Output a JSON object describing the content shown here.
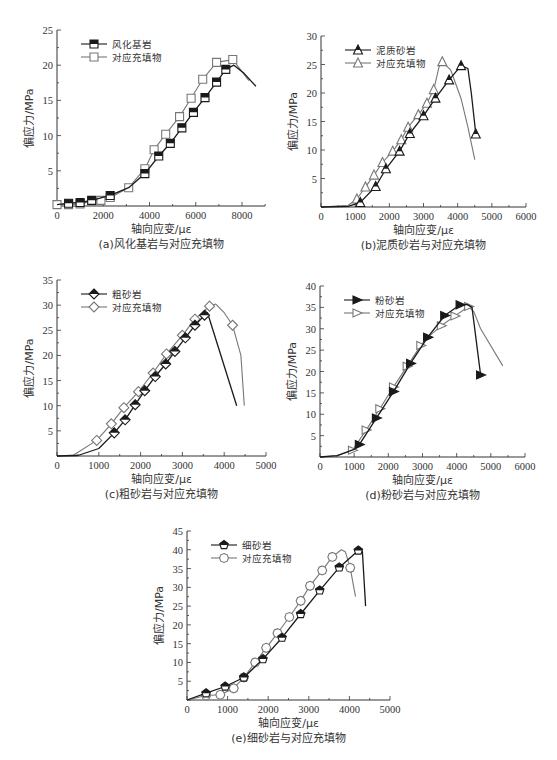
{
  "figure": {
    "panels_count": 5
  },
  "chart_data": [
    {
      "id": "a",
      "type": "line",
      "caption": "(a)风化基岩与对应充填物",
      "xlabel": "轴向应变/με",
      "ylabel": "偏应力/MPa",
      "xlim": [
        0,
        9000
      ],
      "ylim": [
        0,
        25
      ],
      "xticks": [
        0,
        2000,
        4000,
        6000,
        8000
      ],
      "yticks": [
        5,
        10,
        15,
        20,
        25
      ],
      "grid": false,
      "legend_position": "upper-left",
      "box": {
        "x0": 57,
        "y0": 206,
        "x1": 265,
        "y1": 30,
        "xmax_px_value": 9000
      },
      "series": [
        {
          "name": "风化基岩",
          "marker": "square-half-filled",
          "color": "#1a1a1a",
          "points": [
            [
              0,
              0.2
            ],
            [
              500,
              0.4
            ],
            [
              1000,
              0.5
            ],
            [
              1500,
              0.8
            ],
            [
              2300,
              1.5
            ],
            [
              3100,
              2.6
            ],
            [
              3800,
              4.6
            ],
            [
              4400,
              7.1
            ],
            [
              4900,
              8.9
            ],
            [
              5400,
              11.1
            ],
            [
              5900,
              13.3
            ],
            [
              6400,
              15.4
            ],
            [
              6900,
              17.6
            ],
            [
              7300,
              19.4
            ],
            [
              7650,
              20.0
            ],
            [
              8100,
              18.8
            ],
            [
              8600,
              17.0
            ]
          ],
          "markers_at": [
            1,
            2,
            3,
            4,
            6,
            7,
            8,
            9,
            10,
            11,
            12,
            13
          ]
        },
        {
          "name": "对应充填物",
          "marker": "square-open",
          "color": "#777777",
          "points": [
            [
              0,
              0.2
            ],
            [
              500,
              0.2
            ],
            [
              1000,
              0.3
            ],
            [
              1500,
              0.7
            ],
            [
              1900,
              0.8
            ],
            [
              2300,
              1.2
            ],
            [
              3100,
              2.6
            ],
            [
              3800,
              5.3
            ],
            [
              4200,
              8.0
            ],
            [
              4700,
              10.2
            ],
            [
              5300,
              12.7
            ],
            [
              5800,
              15.3
            ],
            [
              6300,
              18.0
            ],
            [
              6900,
              20.4
            ],
            [
              7600,
              20.8
            ],
            [
              7900,
              19.5
            ],
            [
              8300,
              17.8
            ]
          ],
          "markers_at": [
            0,
            1,
            2,
            3,
            4,
            5,
            6,
            7,
            8,
            9,
            10,
            11,
            12,
            13,
            14
          ]
        }
      ]
    },
    {
      "id": "b",
      "type": "line",
      "caption": "(b)泥质砂岩与对应充填物",
      "xlabel": "轴向应变/με",
      "ylabel": "偏应力/MPa",
      "xlim": [
        0,
        6000
      ],
      "ylim": [
        0,
        30
      ],
      "xticks": [
        0,
        1000,
        2000,
        3000,
        4000,
        5000,
        6000
      ],
      "yticks": [
        5,
        10,
        15,
        20,
        25,
        30
      ],
      "grid": false,
      "legend_position": "upper-left",
      "box": {
        "x0": 321,
        "y0": 207,
        "x1": 526,
        "y1": 36
      },
      "series": [
        {
          "name": "泥质砂岩",
          "marker": "triangle-half-filled",
          "color": "#1a1a1a",
          "points": [
            [
              0,
              0
            ],
            [
              800,
              0.1
            ],
            [
              1150,
              0.8
            ],
            [
              1600,
              3.6
            ],
            [
              1900,
              6.7
            ],
            [
              2300,
              9.8
            ],
            [
              2600,
              12.9
            ],
            [
              3000,
              16.0
            ],
            [
              3350,
              19.1
            ],
            [
              3750,
              22.3
            ],
            [
              4100,
              24.8
            ],
            [
              4300,
              24.3
            ],
            [
              4400,
              20
            ],
            [
              4530,
              12.8
            ]
          ],
          "markers_at": [
            2,
            3,
            4,
            5,
            6,
            7,
            8,
            9,
            10,
            13
          ]
        },
        {
          "name": "对应充填物",
          "marker": "triangle-open",
          "color": "#777777",
          "points": [
            [
              0,
              0
            ],
            [
              800,
              0.3
            ],
            [
              1050,
              1.4
            ],
            [
              1300,
              3.5
            ],
            [
              1550,
              5.6
            ],
            [
              1800,
              7.8
            ],
            [
              2100,
              9.8
            ],
            [
              2350,
              11.8
            ],
            [
              2550,
              14.0
            ],
            [
              2850,
              16.2
            ],
            [
              3100,
              18.2
            ],
            [
              3300,
              20.6
            ],
            [
              3450,
              24.5
            ],
            [
              3550,
              25.5
            ],
            [
              3800,
              24.0
            ],
            [
              4100,
              19.0
            ],
            [
              4300,
              14.0
            ],
            [
              4500,
              8.3
            ]
          ],
          "markers_at": [
            2,
            3,
            4,
            5,
            6,
            7,
            8,
            9,
            10,
            11,
            13
          ]
        }
      ]
    },
    {
      "id": "c",
      "type": "line",
      "caption": "(c)粗砂岩与对应充填物",
      "xlabel": "轴向应变/με",
      "ylabel": "偏应力/MPa",
      "xlim": [
        0,
        5000
      ],
      "ylim": [
        0,
        35
      ],
      "xticks": [
        0,
        1000,
        2000,
        3000,
        4000,
        5000
      ],
      "yticks": [
        5,
        10,
        15,
        20,
        25,
        30,
        35
      ],
      "grid": false,
      "legend_position": "upper-left",
      "box": {
        "x0": 57,
        "y0": 456,
        "x1": 266,
        "y1": 280
      },
      "series": [
        {
          "name": "粗砂岩",
          "marker": "diamond-half-filled",
          "color": "#1a1a1a",
          "points": [
            [
              0,
              0
            ],
            [
              500,
              0.1
            ],
            [
              1000,
              1.5
            ],
            [
              1370,
              4.6
            ],
            [
              1630,
              7.2
            ],
            [
              1870,
              10.2
            ],
            [
              2100,
              13.0
            ],
            [
              2350,
              15.8
            ],
            [
              2600,
              18.3
            ],
            [
              2820,
              20.8
            ],
            [
              3070,
              23.5
            ],
            [
              3300,
              26.0
            ],
            [
              3530,
              28.0
            ],
            [
              3600,
              28.5
            ],
            [
              4300,
              10.0
            ]
          ],
          "markers_at": [
            3,
            4,
            5,
            6,
            7,
            8,
            9,
            10,
            11,
            12
          ]
        },
        {
          "name": "对应充填物",
          "marker": "diamond-open",
          "color": "#777777",
          "points": [
            [
              0,
              0
            ],
            [
              400,
              0.2
            ],
            [
              950,
              3.1
            ],
            [
              1300,
              6.4
            ],
            [
              1600,
              9.6
            ],
            [
              1950,
              12.8
            ],
            [
              2300,
              16.5
            ],
            [
              2620,
              20.3
            ],
            [
              3000,
              24.0
            ],
            [
              3300,
              27.2
            ],
            [
              3650,
              29.8
            ],
            [
              3800,
              30.2
            ],
            [
              4000,
              28.5
            ],
            [
              4200,
              26.0
            ],
            [
              4400,
              20.0
            ],
            [
              4480,
              10.0
            ]
          ],
          "markers_at": [
            2,
            3,
            4,
            5,
            6,
            7,
            8,
            9,
            10,
            13
          ]
        }
      ]
    },
    {
      "id": "d",
      "type": "line",
      "caption": "(d)粉砂岩与对应充填物",
      "xlabel": "轴向应变/με",
      "ylabel": "偏应力/MPa",
      "xlim": [
        0,
        6000
      ],
      "ylim": [
        0,
        40
      ],
      "xticks": [
        0,
        1000,
        2000,
        3000,
        4000,
        5000,
        6000
      ],
      "yticks": [
        5,
        10,
        15,
        20,
        25,
        30,
        35,
        40
      ],
      "grid": false,
      "legend_position": "upper-left",
      "box": {
        "x0": 320,
        "y0": 457,
        "x1": 525,
        "y1": 286
      },
      "series": [
        {
          "name": "粉砂岩",
          "marker": "triangle-right-filled",
          "color": "#1a1a1a",
          "points": [
            [
              0,
              0
            ],
            [
              500,
              0.3
            ],
            [
              1000,
              1.8
            ],
            [
              1150,
              2.9
            ],
            [
              1650,
              9.1
            ],
            [
              2150,
              15.3
            ],
            [
              2650,
              21.9
            ],
            [
              3150,
              28.0
            ],
            [
              3650,
              33.1
            ],
            [
              4100,
              35.6
            ],
            [
              4300,
              35.7
            ],
            [
              4450,
              35.0
            ],
            [
              4700,
              19.2
            ]
          ],
          "markers_at": [
            3,
            4,
            5,
            6,
            7,
            8,
            9,
            12
          ]
        },
        {
          "name": "对应充填物",
          "marker": "triangle-right-open",
          "color": "#777777",
          "points": [
            [
              0,
              0
            ],
            [
              500,
              0.3
            ],
            [
              950,
              1.6
            ],
            [
              1350,
              6.3
            ],
            [
              1750,
              11.3
            ],
            [
              2150,
              16.4
            ],
            [
              2550,
              21.2
            ],
            [
              2950,
              26.1
            ],
            [
              3150,
              28.0
            ],
            [
              3550,
              30.7
            ],
            [
              3950,
              33.0
            ],
            [
              4350,
              35.2
            ],
            [
              4500,
              34.0
            ],
            [
              4700,
              30.0
            ],
            [
              5350,
              21.3
            ]
          ],
          "markers_at": [
            2,
            3,
            4,
            5,
            6,
            7,
            8,
            9,
            10,
            11
          ]
        }
      ]
    },
    {
      "id": "e",
      "type": "line",
      "caption": "(e)细砂岩与对应充填物",
      "xlabel": "轴向应变/με",
      "ylabel": "偏应力/MPa",
      "xlim": [
        0,
        5000
      ],
      "ylim": [
        0,
        45
      ],
      "xticks": [
        0,
        1000,
        2000,
        3000,
        4000,
        5000
      ],
      "yticks": [
        5,
        10,
        15,
        20,
        25,
        30,
        35,
        40,
        45
      ],
      "grid": false,
      "legend_position": "upper-left",
      "box": {
        "x0": 187,
        "y0": 700,
        "x1": 390,
        "y1": 531
      },
      "series": [
        {
          "name": "细砂岩",
          "marker": "pentagon-half-filled",
          "color": "#1a1a1a",
          "points": [
            [
              0,
              0
            ],
            [
              470,
              1.8
            ],
            [
              940,
              3.6
            ],
            [
              1400,
              6.0
            ],
            [
              1870,
              10.9
            ],
            [
              2340,
              16.6
            ],
            [
              2800,
              22.9
            ],
            [
              3270,
              29.2
            ],
            [
              3750,
              35.3
            ],
            [
              4220,
              39.8
            ],
            [
              4320,
              39.5
            ],
            [
              4400,
              25.0
            ]
          ],
          "markers_at": [
            1,
            2,
            3,
            4,
            5,
            6,
            7,
            8,
            9
          ]
        },
        {
          "name": "对应充填物",
          "marker": "hexagon-open",
          "color": "#777777",
          "points": [
            [
              0,
              0
            ],
            [
              470,
              1.2
            ],
            [
              820,
              1.4
            ],
            [
              1150,
              3.1
            ],
            [
              1400,
              6.0
            ],
            [
              1680,
              10.0
            ],
            [
              1950,
              13.9
            ],
            [
              2230,
              17.8
            ],
            [
              2520,
              22.1
            ],
            [
              2800,
              26.4
            ],
            [
              3030,
              30.4
            ],
            [
              3330,
              34.5
            ],
            [
              3580,
              38.1
            ],
            [
              3800,
              40.0
            ],
            [
              3900,
              39.5
            ],
            [
              4020,
              35.2
            ],
            [
              4150,
              27.5
            ]
          ],
          "markers_at": [
            1,
            2,
            3,
            4,
            5,
            6,
            7,
            8,
            9,
            10,
            11,
            12,
            15
          ]
        }
      ]
    }
  ]
}
